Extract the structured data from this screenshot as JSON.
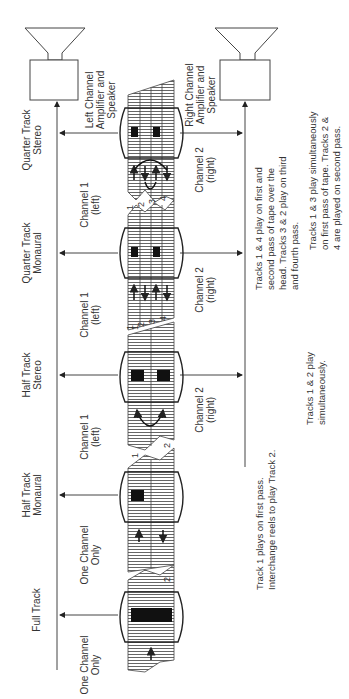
{
  "diagram": {
    "title": "",
    "speakers": {
      "left": {
        "label_lines": [
          "Left Channel",
          "Amplifier and",
          "Speaker"
        ]
      },
      "right": {
        "label_lines": [
          "Right Channel",
          "Amplifier and",
          "Speaker"
        ]
      }
    },
    "formats": [
      {
        "name_lines": [
          "Full Track"
        ],
        "channel_top": [
          "One Channel",
          "Only"
        ],
        "channel_bottom": [],
        "track_numbers": [],
        "note_lines": []
      },
      {
        "name_lines": [
          "Half Track",
          "Monaural"
        ],
        "channel_top": [
          "One Channel",
          "Only"
        ],
        "channel_bottom": [],
        "track_numbers": [
          "1",
          "2"
        ],
        "note_lines": [
          "Track 1 plays on first pass.",
          "Interchange reels to play Track 2."
        ]
      },
      {
        "name_lines": [
          "Half Track",
          "Stereo"
        ],
        "channel_top": [
          "Channel 1",
          "(left)"
        ],
        "channel_bottom": [
          "Channel 2",
          "(right)"
        ],
        "track_numbers": [
          "1",
          "2"
        ],
        "note_lines": [
          "Tracks 1 & 2 play",
          "simultaneously."
        ]
      },
      {
        "name_lines": [
          "Quarter Track",
          "Monaural"
        ],
        "channel_top": [
          "Channel 1",
          "(left)"
        ],
        "channel_bottom": [
          "Channel 2",
          "(right)"
        ],
        "track_numbers": [
          "1",
          "2",
          "3",
          "4"
        ],
        "note_lines": [
          "Tracks 1 & 4 play on first and",
          "second pass of tape over the",
          "head. Tracks 3 & 2 play on third",
          "and fourth pass."
        ]
      },
      {
        "name_lines": [
          "Quarter Track",
          "Stereo"
        ],
        "channel_top": [
          "Channel 1",
          "(left)"
        ],
        "channel_bottom": [
          "Channel 2",
          "(right)"
        ],
        "track_numbers": [
          "1",
          "2",
          "3",
          "4"
        ],
        "note_lines": [
          "Tracks 1 & 3 play simultaneously",
          "on first pass of tape. Tracks 2 &",
          "4 are played on second pass."
        ]
      }
    ]
  }
}
